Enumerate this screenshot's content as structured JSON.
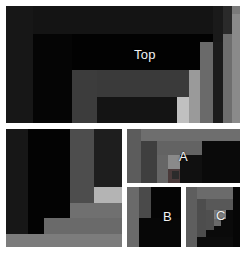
{
  "figure": {
    "title": "",
    "background": "#ffffff",
    "width": 246,
    "height": 253
  },
  "palette": {
    "white": "#ffffff",
    "near_black": "#0b0b0b",
    "black": "#000000",
    "very_dark": "#141414",
    "dark": "#1d1d1d",
    "dark2": "#242424",
    "dark3": "#2c2c2c",
    "mid_dark": "#3a3a3a",
    "mid": "#4a4a4a",
    "mid_light": "#585858",
    "gray": "#6e6e6e",
    "gray_light": "#7e7e7e",
    "light": "#9a9a9a",
    "lighter": "#b0b0b0",
    "lightest": "#c8c8c8",
    "text": "#f2f2f2"
  },
  "panels": [
    {
      "id": "top",
      "label": "Top",
      "label_x": 128,
      "label_y": 42,
      "label_size": "normal",
      "x": 6,
      "y": 6,
      "w": 234,
      "h": 117,
      "border": "#ffffff",
      "base": "#0d0d0d",
      "cells": [
        {
          "name": "outer-left-band",
          "x": 0,
          "y": 0,
          "w": 27,
          "h": 117,
          "fill": "#171717"
        },
        {
          "name": "outer-top-band",
          "x": 27,
          "y": 0,
          "w": 180,
          "h": 28,
          "fill": "#141414"
        },
        {
          "name": "right-bar-1",
          "x": 207,
          "y": 0,
          "w": 10,
          "h": 117,
          "fill": "#1a1a1a"
        },
        {
          "name": "right-bar-2",
          "x": 217,
          "y": 0,
          "w": 9,
          "h": 117,
          "fill": "#2a2a2a"
        },
        {
          "name": "right-bar-3",
          "x": 226,
          "y": 0,
          "w": 8,
          "h": 117,
          "fill": "#7a7a7a"
        },
        {
          "name": "inner-left-col",
          "x": 27,
          "y": 28,
          "w": 39,
          "h": 89,
          "fill": "#050505"
        },
        {
          "name": "inner-top-strip",
          "x": 66,
          "y": 28,
          "w": 141,
          "h": 36,
          "fill": "#020202"
        },
        {
          "name": "mid-left-block",
          "x": 66,
          "y": 64,
          "w": 25,
          "h": 53,
          "fill": "#3c3c3c"
        },
        {
          "name": "mid-wide-bar",
          "x": 91,
          "y": 64,
          "w": 101,
          "h": 27,
          "fill": "#3a3a3a"
        },
        {
          "name": "mid-lower-fill",
          "x": 91,
          "y": 91,
          "w": 80,
          "h": 26,
          "fill": "#141414"
        },
        {
          "name": "pale-bar",
          "x": 171,
          "y": 91,
          "w": 12,
          "h": 26,
          "fill": "#c0c0c0"
        },
        {
          "name": "tall-bar-a",
          "x": 183,
          "y": 64,
          "w": 11,
          "h": 53,
          "fill": "#9a9a9a"
        },
        {
          "name": "tall-bar-b",
          "x": 194,
          "y": 36,
          "w": 13,
          "h": 81,
          "fill": "#6a6a6a"
        },
        {
          "name": "tall-bar-c",
          "x": 207,
          "y": 36,
          "w": 10,
          "h": 81,
          "fill": "#1c1c1c"
        },
        {
          "name": "tall-bar-d",
          "x": 217,
          "y": 28,
          "w": 9,
          "h": 89,
          "fill": "#6e6e6e"
        },
        {
          "name": "tall-bar-e",
          "x": 226,
          "y": 8,
          "w": 8,
          "h": 109,
          "fill": "#8a8a8a"
        }
      ]
    },
    {
      "id": "left",
      "label": "Left",
      "label_x": 55,
      "label_y": 172,
      "label_size": "normal",
      "x": 6,
      "y": 129,
      "w": 116,
      "h": 118,
      "border": "#ffffff",
      "base": "#050505",
      "cells": [
        {
          "name": "left-outer-col",
          "x": 0,
          "y": 0,
          "w": 22,
          "h": 118,
          "fill": "#171717"
        },
        {
          "name": "left-black-field",
          "x": 22,
          "y": 0,
          "w": 42,
          "h": 118,
          "fill": "#030303"
        },
        {
          "name": "left-tall-bar",
          "x": 64,
          "y": 0,
          "w": 24,
          "h": 74,
          "fill": "#4d4d4d"
        },
        {
          "name": "left-dark-right",
          "x": 88,
          "y": 0,
          "w": 28,
          "h": 58,
          "fill": "#1e1e1e"
        },
        {
          "name": "left-pale-block",
          "x": 88,
          "y": 58,
          "w": 28,
          "h": 16,
          "fill": "#b4b4b4"
        },
        {
          "name": "left-step-bar-1",
          "x": 64,
          "y": 74,
          "w": 52,
          "h": 15,
          "fill": "#707070"
        },
        {
          "name": "left-step-bar-2",
          "x": 38,
          "y": 89,
          "w": 78,
          "h": 16,
          "fill": "#6a6a6a"
        },
        {
          "name": "left-step-bar-3",
          "x": 0,
          "y": 105,
          "w": 116,
          "h": 13,
          "fill": "#7c7c7c"
        }
      ]
    },
    {
      "id": "a",
      "label": "A",
      "label_x": 52,
      "label_y": 21,
      "label_size": "normal",
      "x": 127,
      "y": 129,
      "w": 113,
      "h": 54,
      "border": "#ffffff",
      "base": "#101010",
      "cells": [
        {
          "name": "a-left-col",
          "x": 0,
          "y": 0,
          "w": 14,
          "h": 54,
          "fill": "#5c5c5c"
        },
        {
          "name": "a-top-bar",
          "x": 14,
          "y": 0,
          "w": 99,
          "h": 12,
          "fill": "#6e6e6e"
        },
        {
          "name": "a-right-dark",
          "x": 75,
          "y": 12,
          "w": 38,
          "h": 42,
          "fill": "#0a0a0a"
        },
        {
          "name": "a-second-col",
          "x": 14,
          "y": 12,
          "w": 16,
          "h": 42,
          "fill": "#3f3f3f"
        },
        {
          "name": "a-mid-bar",
          "x": 30,
          "y": 12,
          "w": 45,
          "h": 14,
          "fill": "#636363"
        },
        {
          "name": "a-inner-col",
          "x": 30,
          "y": 26,
          "w": 11,
          "h": 28,
          "fill": "#666666"
        },
        {
          "name": "a-inner-dark",
          "x": 41,
          "y": 26,
          "w": 12,
          "h": 28,
          "fill": "#0b0b0b"
        },
        {
          "name": "a-inner-light",
          "x": 41,
          "y": 26,
          "w": 12,
          "h": 14,
          "fill": "#8a8a8a"
        },
        {
          "name": "a-inner-small",
          "x": 41,
          "y": 40,
          "w": 12,
          "h": 14,
          "fill": "#4a3a3a"
        },
        {
          "name": "a-inner-seed",
          "x": 45,
          "y": 42,
          "w": 7,
          "h": 8,
          "fill": "#2b2b2b"
        }
      ]
    },
    {
      "id": "b",
      "label": "B",
      "label_x": 36,
      "label_y": 23,
      "label_size": "normal",
      "x": 127,
      "y": 187,
      "w": 54,
      "h": 60,
      "border": "#ffffff",
      "base": "#050505",
      "cells": [
        {
          "name": "b-left-col",
          "x": 0,
          "y": 0,
          "w": 12,
          "h": 60,
          "fill": "#6a6a6a"
        },
        {
          "name": "b-second-col",
          "x": 12,
          "y": 0,
          "w": 12,
          "h": 31,
          "fill": "#4a4a4a"
        },
        {
          "name": "b-right-field",
          "x": 24,
          "y": 0,
          "w": 30,
          "h": 60,
          "fill": "#050505"
        },
        {
          "name": "b-lower-field",
          "x": 12,
          "y": 31,
          "w": 42,
          "h": 29,
          "fill": "#070707"
        }
      ]
    },
    {
      "id": "c",
      "label": "C",
      "label_x": 30,
      "label_y": 22,
      "label_size": "normal",
      "x": 186,
      "y": 187,
      "w": 54,
      "h": 60,
      "border": "#ffffff",
      "base": "#070707",
      "cells": [
        {
          "name": "c-left-col",
          "x": 0,
          "y": 0,
          "w": 11,
          "h": 60,
          "fill": "#5e5e5e"
        },
        {
          "name": "c-top-bar",
          "x": 11,
          "y": 0,
          "w": 36,
          "h": 12,
          "fill": "#6b6b6b"
        },
        {
          "name": "c-right-dark",
          "x": 47,
          "y": 0,
          "w": 7,
          "h": 60,
          "fill": "#060606"
        },
        {
          "name": "c-second-col",
          "x": 11,
          "y": 12,
          "w": 9,
          "h": 38,
          "fill": "#4d4d4d"
        },
        {
          "name": "c-inner-bar",
          "x": 20,
          "y": 12,
          "w": 27,
          "h": 11,
          "fill": "#585858"
        },
        {
          "name": "c-inner-dark",
          "x": 20,
          "y": 23,
          "w": 27,
          "h": 27,
          "fill": "#0a0a0a"
        },
        {
          "name": "c-inner-col",
          "x": 20,
          "y": 23,
          "w": 8,
          "h": 20,
          "fill": "#4f4f4f"
        },
        {
          "name": "c-inner-light",
          "x": 28,
          "y": 23,
          "w": 12,
          "h": 9,
          "fill": "#7e7e7e"
        },
        {
          "name": "c-inner-seed",
          "x": 28,
          "y": 32,
          "w": 7,
          "h": 7,
          "fill": "#6a6a6a"
        },
        {
          "name": "c-bottom-strip",
          "x": 11,
          "y": 50,
          "w": 36,
          "h": 10,
          "fill": "#0c0c0c"
        }
      ]
    }
  ]
}
